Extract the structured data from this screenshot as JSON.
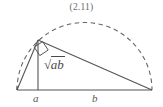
{
  "figure": {
    "equation_number": "(2.11)",
    "labels": {
      "altitude": {
        "radical_symbol": "√",
        "radicand": "ab",
        "full": "√ab"
      },
      "left_segment": "a",
      "right_segment": "b"
    },
    "colors": {
      "stroke_solid": "#555555",
      "stroke_dashed": "#666666",
      "text": "#555555",
      "equation_number": "#6a6a6a",
      "background": "#ffffff"
    },
    "geometry": {
      "type": "semicircle-inscribed-right-triangle",
      "baseline": {
        "x1": 17,
        "y1": 90,
        "x2": 152,
        "y2": 90
      },
      "apex": {
        "x": 38,
        "y": 40
      },
      "altitude_foot": {
        "x": 38,
        "y": 90
      },
      "semicircle": {
        "center_x": 84.5,
        "center_y": 90,
        "radius": 67.5
      },
      "right_angle_marker_at": "apex",
      "segment_a_span": [
        17,
        38
      ],
      "segment_b_span": [
        38,
        152
      ]
    }
  }
}
